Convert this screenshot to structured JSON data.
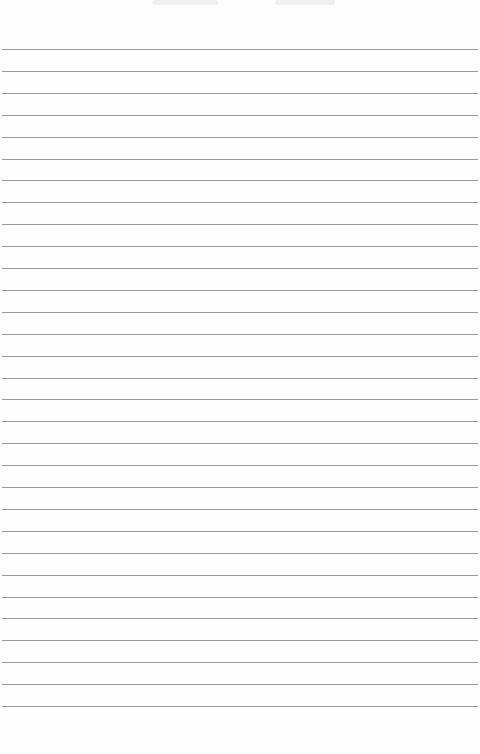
{
  "notepad": {
    "line_color": "#9a9a9a",
    "paper_color": "#fdfdfd",
    "first_line_y": 49,
    "line_spacing": 21.9,
    "line_count": 31,
    "lines": []
  }
}
